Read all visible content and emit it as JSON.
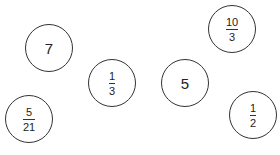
{
  "circles": [
    {
      "id": "c1",
      "type": "whole",
      "value": "7",
      "cx": 49,
      "cy": 48
    },
    {
      "id": "c2",
      "type": "fraction",
      "numerator": "10",
      "denominator": "3",
      "cx": 232,
      "cy": 29
    },
    {
      "id": "c3",
      "type": "fraction",
      "numerator": "1",
      "denominator": "3",
      "cx": 112,
      "cy": 83
    },
    {
      "id": "c4",
      "type": "whole",
      "value": "5",
      "cx": 185,
      "cy": 83
    },
    {
      "id": "c5",
      "type": "fraction",
      "numerator": "5",
      "denominator": "21",
      "cx": 29,
      "cy": 119
    },
    {
      "id": "c6",
      "type": "fraction",
      "numerator": "1",
      "denominator": "2",
      "cx": 253,
      "cy": 115
    }
  ]
}
